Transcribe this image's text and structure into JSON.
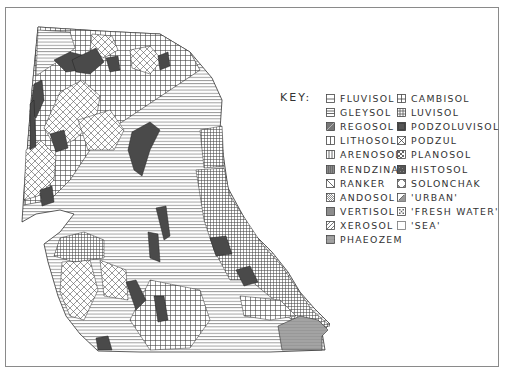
{
  "figure": {
    "type": "soil-map",
    "frame_color": "#8a8a8a"
  },
  "key": {
    "title": "KEY:",
    "columns": [
      [
        {
          "label": "FLUVISOL",
          "pattern": "horizontal-split"
        },
        {
          "label": "GLEYSOL",
          "pattern": "horizontal-lines"
        },
        {
          "label": "REGOSOL",
          "pattern": "dense-dark-diagonal"
        },
        {
          "label": "LITHOSOL",
          "pattern": "vertical-split"
        },
        {
          "label": "ARENOSOL",
          "pattern": "vertical-lines"
        },
        {
          "label": "RENDZINA",
          "pattern": "dense-vertical"
        },
        {
          "label": "RANKER",
          "pattern": "single-diagonal"
        },
        {
          "label": "ANDOSOL",
          "pattern": "diagonal-lines"
        },
        {
          "label": "VERTISOL",
          "pattern": "solid-gray"
        },
        {
          "label": "XEROSOL",
          "pattern": "sparse-diagonal"
        },
        {
          "label": "PHAEOZEM",
          "pattern": "dotted-gray"
        }
      ],
      [
        {
          "label": "CAMBISOL",
          "pattern": "quad-split"
        },
        {
          "label": "LUVISOL",
          "pattern": "grid"
        },
        {
          "label": "PODZOLUVISOL",
          "pattern": "solid-dark"
        },
        {
          "label": "PODZUL",
          "pattern": "cross-hatch"
        },
        {
          "label": "PLANOSOL",
          "pattern": "checker"
        },
        {
          "label": "HISTOSOL",
          "pattern": "dark-stipple"
        },
        {
          "label": "SOLONCHAK",
          "pattern": "corner-marks"
        },
        {
          "label": "'URBAN'",
          "pattern": "half-diagonal"
        },
        {
          "label": "'FRESH WATER'",
          "pattern": "dotted-check"
        },
        {
          "label": "'SEA'",
          "pattern": "blank"
        }
      ]
    ]
  },
  "colors": {
    "ink": "#333333",
    "histosol_fill": "#4a4a4a",
    "phaeozem_fill": "#9a9a9a",
    "paper": "#ffffff"
  }
}
